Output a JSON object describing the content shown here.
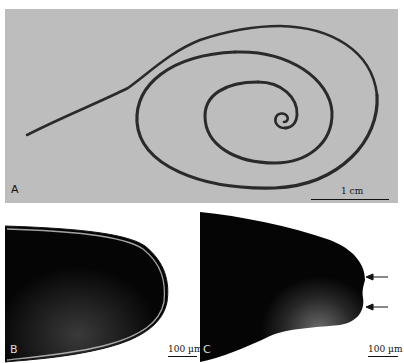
{
  "figure": {
    "panels": [
      {
        "id": "A",
        "label": "A",
        "description": "whole worm coiled in spiral",
        "background": "#bdbdbd",
        "worm_color": "#2a2a2a",
        "scale_bar": {
          "label": "1 cm"
        }
      },
      {
        "id": "B",
        "label": "B",
        "description": "rounded tip, dark with bright rim",
        "scale_bar": {
          "label": "100 µm"
        }
      },
      {
        "id": "C",
        "label": "C",
        "description": "swollen tip with two arrows",
        "scale_bar": {
          "label": "100 µm"
        },
        "arrows": 2
      }
    ]
  }
}
